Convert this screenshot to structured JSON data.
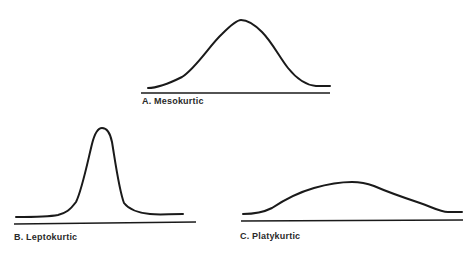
{
  "figure": {
    "panels": [
      {
        "id": "A",
        "label": "A.  Mesokurtic",
        "shape": "normal bell curve"
      },
      {
        "id": "B",
        "label": "B.  Leptokurtic",
        "shape": "tall narrow peaked curve"
      },
      {
        "id": "C",
        "label": "C.  Platykurtic",
        "shape": "low flat wide curve"
      }
    ],
    "stroke_color": "#1a1a1a",
    "background": "#ffffff"
  }
}
